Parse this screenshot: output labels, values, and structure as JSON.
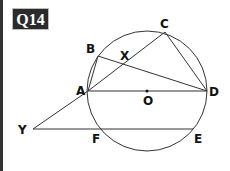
{
  "question": {
    "label": "Q14"
  },
  "diagram": {
    "circle": {
      "cx": 147,
      "cy": 91,
      "r": 60,
      "stroke": "#333333"
    },
    "points": {
      "A": {
        "x": 88,
        "y": 91,
        "label": "A"
      },
      "B": {
        "x": 98,
        "y": 56,
        "label": "B"
      },
      "C": {
        "x": 165,
        "y": 32,
        "label": "C"
      },
      "D": {
        "x": 207,
        "y": 91,
        "label": "D"
      },
      "E": {
        "x": 193,
        "y": 129,
        "label": "E"
      },
      "F": {
        "x": 102,
        "y": 129,
        "label": "F"
      },
      "O": {
        "x": 147,
        "y": 91,
        "label": "O"
      },
      "X": {
        "x": 125,
        "y": 64,
        "label": "X"
      },
      "Y": {
        "x": 33,
        "y": 129,
        "label": "Y"
      }
    },
    "segments": [
      [
        "A",
        "D"
      ],
      [
        "A",
        "C"
      ],
      [
        "B",
        "D"
      ],
      [
        "C",
        "D"
      ],
      [
        "A",
        "B"
      ],
      [
        "Y",
        "A"
      ],
      [
        "Y",
        "E"
      ]
    ],
    "line_color": "#333333"
  }
}
